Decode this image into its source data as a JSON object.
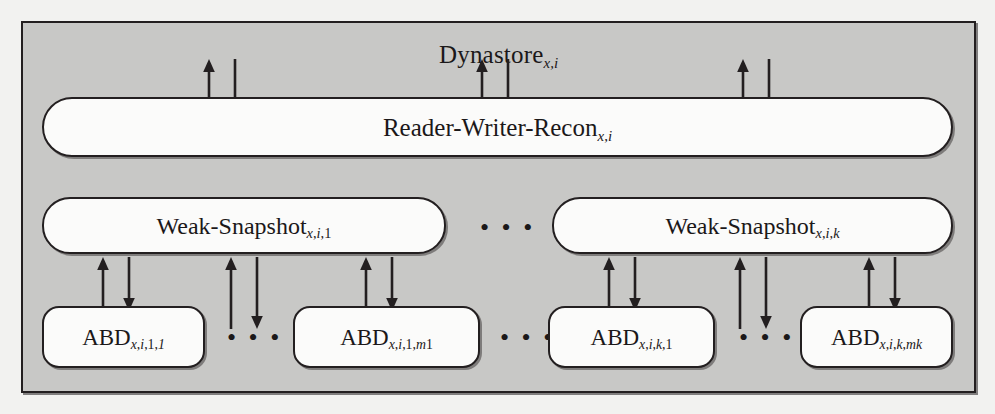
{
  "figure": {
    "type": "layered-architecture-diagram",
    "background_color": "#c8c8c6",
    "box_fill_color": "#fbfbfa",
    "line_color": "#231f20"
  },
  "outer": {
    "name": "Dynastore",
    "title_base": "Dynastore",
    "title_sub": "x,i"
  },
  "layers": [
    {
      "level": 1,
      "name": "reader-writer-recon",
      "base": "Reader-Writer-Recon",
      "sub": "x,i"
    },
    {
      "level": 2,
      "name": "weak-snapshot",
      "boxes": [
        {
          "base": "Weak-Snapshot",
          "sub": "x,i,1"
        },
        {
          "base": "Weak-Snapshot",
          "sub": "x,i,k"
        }
      ]
    },
    {
      "level": 3,
      "name": "abd",
      "boxes": [
        {
          "base": "ABD",
          "sub": "x,i,1,1"
        },
        {
          "base": "ABD",
          "sub": "x,i,1,m1"
        },
        {
          "base": "ABD",
          "sub": "x,i,k,1"
        },
        {
          "base": "ABD",
          "sub": "x,i,k,mk"
        }
      ]
    }
  ],
  "rwr": {
    "base": "Reader-Writer-Recon",
    "sub_x": "x",
    "sub_comma1": ",",
    "sub_i": "i"
  },
  "ws_left": {
    "base": "Weak-Snapshot",
    "sub_x": "x",
    "sub_c1": ",",
    "sub_i": "i",
    "sub_c2": ",",
    "sub_last": "1"
  },
  "ws_right": {
    "base": "Weak-Snapshot",
    "sub_x": "x",
    "sub_c1": ",",
    "sub_i": "i",
    "sub_c2": ",",
    "sub_last": "k"
  },
  "abd1": {
    "base": "ABD",
    "sub_x": "x",
    "sub_c1": ",",
    "sub_i": "i",
    "sub_c2": ",",
    "sub_g": "1",
    "sub_c3": ",",
    "sub_m": "1",
    "sub_mn": ""
  },
  "abd2": {
    "base": "ABD",
    "sub_x": "x",
    "sub_c1": ",",
    "sub_i": "i",
    "sub_c2": ",",
    "sub_g": "1",
    "sub_c3": ",",
    "sub_m": "m",
    "sub_mn": "1"
  },
  "abd3": {
    "base": "ABD",
    "sub_x": "x",
    "sub_c1": ",",
    "sub_i": "i",
    "sub_c2": ",",
    "sub_g": "k",
    "sub_c3": ",",
    "sub_m": "1",
    "sub_mn": ""
  },
  "abd4": {
    "base": "ABD",
    "sub_x": "x",
    "sub_c1": ",",
    "sub_i": "i",
    "sub_c2": ",",
    "sub_g": "k",
    "sub_c3": ",",
    "sub_m": "m",
    "sub_mn": "k"
  },
  "ellipsis": {
    "weak_snapshot_row": "• • •",
    "abd_row_1": "• • •",
    "abd_row_2": "• • •",
    "abd_row_3": "• • •"
  },
  "arrows": {
    "description": "bidirectional call/return pairs between adjacent layers",
    "upward_label": "return",
    "downward_label": "invoke",
    "groups_layer1_to_layer2": 3,
    "groups_layer2_to_layer3": 6
  }
}
